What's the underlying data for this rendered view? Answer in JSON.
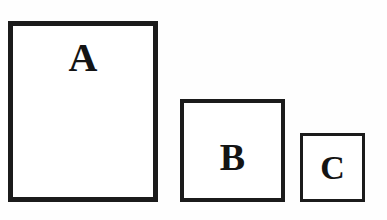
{
  "figure": {
    "background_color": "#fefefe",
    "stroke_color": "#1b1b1b",
    "text_color": "#141414",
    "shapes": [
      {
        "id": "a",
        "label": "A",
        "kind": "square-outline",
        "x": 8,
        "y": 21,
        "width": 150,
        "height": 181,
        "border_width": 5
      },
      {
        "id": "b",
        "label": "B",
        "kind": "square-outline",
        "x": 180,
        "y": 99,
        "width": 105,
        "height": 103,
        "border_width": 4
      },
      {
        "id": "c",
        "label": "C",
        "kind": "square-outline",
        "x": 300,
        "y": 133,
        "width": 65,
        "height": 69,
        "border_width": 3
      }
    ]
  }
}
